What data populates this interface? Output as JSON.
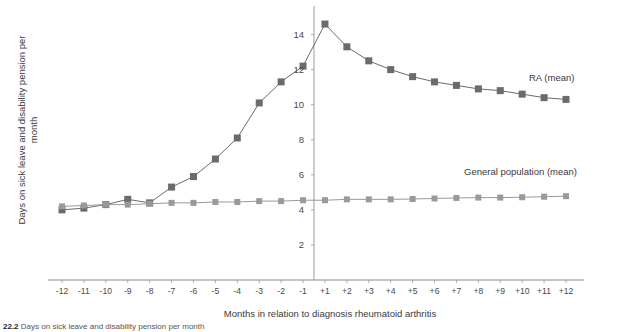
{
  "chart_data": {
    "type": "line",
    "title": "",
    "xlabel": "Months in relation to diagnosis rheumatoid arthritis",
    "ylabel": "Days on sick leave and disability pension per\nmonth",
    "x": [
      "-12",
      "-11",
      "-10",
      "-9",
      "-8",
      "-7",
      "-6",
      "-5",
      "-4",
      "-3",
      "-2",
      "-1",
      "+1",
      "+2",
      "+3",
      "+4",
      "+5",
      "+6",
      "+7",
      "+8",
      "+9",
      "+10",
      "+11",
      "+12"
    ],
    "xlim": [
      -12.5,
      12.5
    ],
    "ylim": [
      0,
      15.4
    ],
    "yticks": [
      2,
      4,
      6,
      8,
      10,
      12,
      14
    ],
    "grid": false,
    "legend_position": "inline-right",
    "series": [
      {
        "name": "RA (mean)",
        "color": "#6b6b6b",
        "values": [
          4.0,
          4.1,
          4.3,
          4.6,
          4.4,
          5.3,
          5.9,
          6.9,
          8.1,
          10.1,
          11.3,
          12.2,
          14.6,
          13.3,
          12.5,
          12.0,
          11.6,
          11.3,
          11.1,
          10.9,
          10.8,
          10.6,
          10.4,
          10.3
        ]
      },
      {
        "name": "General population (mean)",
        "color": "#9a9a9a",
        "values": [
          4.2,
          4.25,
          4.3,
          4.3,
          4.35,
          4.4,
          4.4,
          4.45,
          4.45,
          4.5,
          4.5,
          4.55,
          4.55,
          4.6,
          4.6,
          4.6,
          4.62,
          4.65,
          4.68,
          4.7,
          4.7,
          4.72,
          4.75,
          4.78
        ]
      }
    ],
    "annotations": [
      {
        "name": "ra-series-label",
        "text": "RA (mean)"
      },
      {
        "name": "general-population-series-label",
        "text": "General population (mean)"
      }
    ]
  },
  "caption": {
    "number": "22.2",
    "text": "Days on sick leave and disability pension per month"
  }
}
